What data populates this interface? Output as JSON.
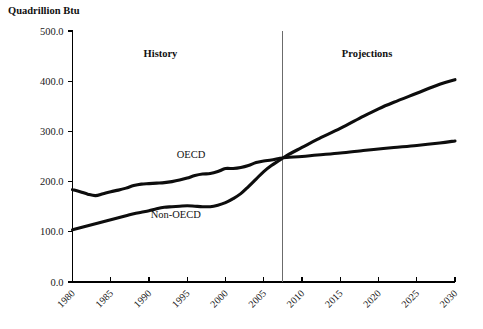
{
  "chart_data": {
    "type": "line",
    "title": "Quadrillion Btu",
    "xlabel": "",
    "ylabel": "Quadrillion Btu",
    "xlim": [
      1980,
      2030
    ],
    "ylim": [
      0.0,
      500.0
    ],
    "grid": false,
    "legend_position": "inline-labels",
    "y_ticks": [
      "0.0",
      "100.0",
      "200.0",
      "300.0",
      "400.0",
      "500.0"
    ],
    "y_tick_values": [
      0,
      100,
      200,
      300,
      400,
      500
    ],
    "x_ticks": [
      "1980",
      "1985",
      "1990",
      "1995",
      "2000",
      "2005",
      "2010",
      "2015",
      "2020",
      "2025",
      "2030"
    ],
    "x_tick_values": [
      1980,
      1985,
      1990,
      1995,
      2000,
      2005,
      2010,
      2015,
      2020,
      2025,
      2030
    ],
    "annotations": [
      {
        "text": "History",
        "x": 1991.5,
        "y": 455,
        "bold": true
      },
      {
        "text": "Projections",
        "x": 2018.5,
        "y": 455,
        "bold": true
      },
      {
        "text": "OECD",
        "x": 1995.5,
        "y": 254,
        "bold": false
      },
      {
        "text": "Non-OECD",
        "x": 1993.5,
        "y": 135,
        "bold": false
      }
    ],
    "history_projection_divider_x": 2007.5,
    "series": [
      {
        "name": "OECD",
        "color": "#0d0d0d",
        "x": [
          1980,
          1981,
          1982,
          1983,
          1984,
          1985,
          1986,
          1987,
          1988,
          1989,
          1990,
          1991,
          1992,
          1993,
          1994,
          1995,
          1996,
          1997,
          1998,
          1999,
          2000,
          2001,
          2002,
          2003,
          2004,
          2005,
          2006,
          2007,
          2008,
          2010,
          2012,
          2015,
          2018,
          2020,
          2022,
          2025,
          2028,
          2030
        ],
        "values": [
          184,
          180,
          175,
          172,
          176,
          180,
          183,
          187,
          192,
          195,
          196,
          197,
          198,
          200,
          203,
          207,
          212,
          215,
          216,
          220,
          226,
          226,
          228,
          232,
          238,
          241,
          243,
          246,
          248,
          250,
          253,
          257,
          262,
          265,
          268,
          272,
          277,
          281
        ]
      },
      {
        "name": "Non-OECD",
        "color": "#0d0d0d",
        "x": [
          1980,
          1981,
          1982,
          1983,
          1984,
          1985,
          1986,
          1987,
          1988,
          1989,
          1990,
          1991,
          1992,
          1993,
          1994,
          1995,
          1996,
          1997,
          1998,
          1999,
          2000,
          2001,
          2002,
          2003,
          2004,
          2005,
          2006,
          2007,
          2008,
          2010,
          2012,
          2015,
          2018,
          2020,
          2022,
          2025,
          2028,
          2030
        ],
        "values": [
          104,
          108,
          112,
          116,
          120,
          124,
          128,
          132,
          136,
          139,
          142,
          146,
          149,
          150,
          151,
          152,
          151,
          150,
          150,
          153,
          158,
          166,
          176,
          190,
          205,
          220,
          232,
          242,
          252,
          268,
          284,
          306,
          330,
          345,
          358,
          376,
          394,
          403
        ]
      }
    ]
  }
}
